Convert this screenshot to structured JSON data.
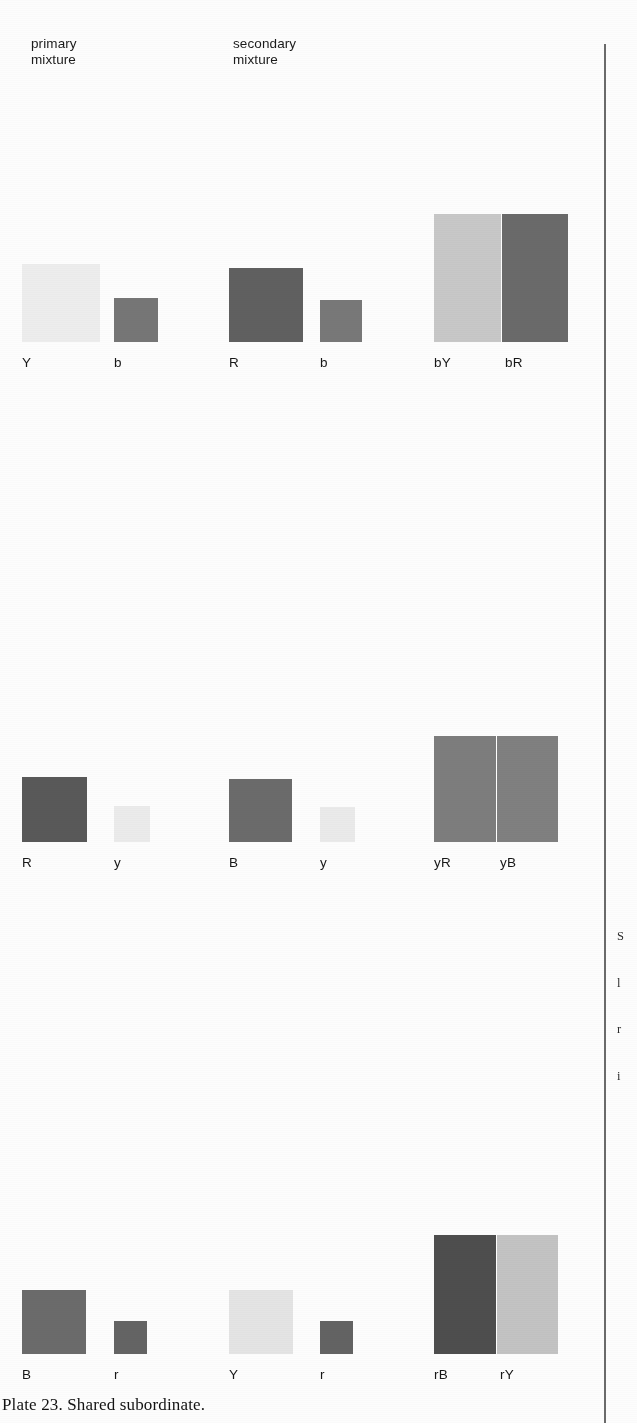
{
  "plate": {
    "caption": "Plate 23. Shared subordinate.",
    "background_color": "#fdfdfd",
    "rule_color": "#4a4a4a"
  },
  "headers": {
    "primary": "primary\nmixture",
    "secondary": "secondary\nmixture"
  },
  "margin_note": {
    "lines": [
      "S",
      "l",
      "r",
      "i"
    ]
  },
  "rows": [
    {
      "id": "row-0",
      "primary": {
        "major": {
          "label": "Y",
          "color": "#ededed",
          "size": 78
        },
        "minor": {
          "label": "b",
          "color": "#767676",
          "size": 44
        }
      },
      "secondary": {
        "major": {
          "label": "R",
          "color": "#606060",
          "size": 74
        },
        "minor": {
          "label": "b",
          "color": "#787878",
          "size": 42
        }
      },
      "result": {
        "left": {
          "label": "bY",
          "color": "#c8c8c8"
        },
        "right": {
          "label": "bR",
          "color": "#6a6a6a"
        },
        "width": 134,
        "height": 128
      }
    },
    {
      "id": "row-1",
      "primary": {
        "major": {
          "label": "R",
          "color": "#595959",
          "size": 65
        },
        "minor": {
          "label": "y",
          "color": "#ebebeb",
          "size": 36
        }
      },
      "secondary": {
        "major": {
          "label": "B",
          "color": "#6b6b6b",
          "size": 63
        },
        "minor": {
          "label": "y",
          "color": "#eaeaea",
          "size": 35
        }
      },
      "result": {
        "left": {
          "label": "yR",
          "color": "#7d7d7d"
        },
        "right": {
          "label": "yB",
          "color": "#808080"
        },
        "width": 124,
        "height": 106
      }
    },
    {
      "id": "row-2",
      "primary": {
        "major": {
          "label": "B",
          "color": "#6b6b6b",
          "size": 64
        },
        "minor": {
          "label": "r",
          "color": "#646464",
          "size": 33
        }
      },
      "secondary": {
        "major": {
          "label": "Y",
          "color": "#e4e4e4",
          "size": 64
        },
        "minor": {
          "label": "r",
          "color": "#636363",
          "size": 33
        }
      },
      "result": {
        "left": {
          "label": "rB",
          "color": "#4e4e4e"
        },
        "right": {
          "label": "rY",
          "color": "#c3c3c3"
        },
        "width": 124,
        "height": 119
      }
    }
  ]
}
